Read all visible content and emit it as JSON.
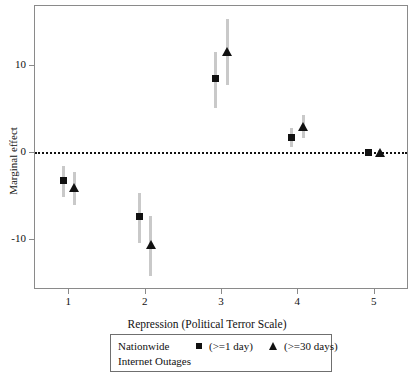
{
  "chart_data": {
    "type": "scatter",
    "title": "",
    "xlabel": "Repression (Political Terror Scale)",
    "ylabel": "Marginal effect",
    "xlim": [
      0.55,
      5.45
    ],
    "ylim": [
      -15.5,
      15.5
    ],
    "xticks": [
      "1",
      "2",
      "3",
      "4",
      "5"
    ],
    "xtick_values": [
      1,
      2,
      3,
      4,
      5
    ],
    "yticks": [
      "10",
      "0",
      "-10"
    ],
    "ytick_values": [
      10,
      0,
      -10
    ],
    "grid": false,
    "zero_reference_line": 0,
    "legend_position": "below-axes",
    "categories": [
      1,
      2,
      3,
      4,
      5
    ],
    "series": [
      {
        "name": "(>=1 day)",
        "marker": "square",
        "color": "#111111",
        "x": [
          0.93,
          1.93,
          2.93,
          3.93,
          4.93
        ],
        "values": [
          -3.3,
          -7.4,
          8.4,
          1.7,
          -0.1
        ],
        "ci_low": [
          -5.2,
          -10.5,
          5.0,
          0.6,
          -0.2
        ],
        "ci_high": [
          -1.6,
          -4.7,
          11.5,
          2.8,
          0.1
        ]
      },
      {
        "name": "(>=30 days)",
        "marker": "triangle",
        "color": "#111111",
        "x": [
          1.08,
          2.08,
          3.08,
          4.08,
          5.08
        ],
        "values": [
          -4.1,
          -10.6,
          11.5,
          2.9,
          0.0
        ],
        "ci_low": [
          -6.1,
          -14.3,
          7.7,
          1.6,
          -0.1
        ],
        "ci_high": [
          -2.3,
          -7.4,
          15.3,
          4.2,
          0.2
        ]
      }
    ]
  },
  "axes": {
    "y_title": "Marginal effect",
    "x_title": "Repression (Political Terror Scale)",
    "y_tick_labels": [
      "10",
      "0",
      "-10"
    ],
    "x_tick_labels": [
      "1",
      "2",
      "3",
      "4",
      "5"
    ]
  },
  "legend": {
    "title_line1": "Nationwide",
    "title_line2": "Internet Outages",
    "entries": [
      {
        "label": "(>=1 day)",
        "marker": "square-marker"
      },
      {
        "label": "(>=30 days)",
        "marker": "triangle-marker"
      }
    ]
  },
  "colors": {
    "marker": "#111111",
    "errorbar": "#c9c9c9",
    "axis": "#8a8a8a",
    "zero_line": "#111111",
    "background": "#ffffff"
  }
}
